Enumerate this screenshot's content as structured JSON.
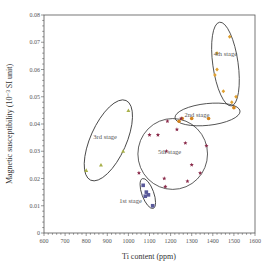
{
  "chart_data": {
    "type": "scatter",
    "title": "",
    "xlabel": "Ti content (ppm)",
    "ylabel": "Magnetic susceptibility (10⁻³ SI unit)",
    "xlim": [
      600,
      1600
    ],
    "ylim": [
      0,
      0.08
    ],
    "x_ticks": [
      "600",
      "700",
      "800",
      "900",
      "1000",
      "1100",
      "1200",
      "1300",
      "1400",
      "1500",
      "1600"
    ],
    "y_ticks": [
      "0",
      "0.01",
      "0.02",
      "0.03",
      "0.04",
      "0.05",
      "0.06",
      "0.07",
      "0.08"
    ],
    "grid": false,
    "legend": "none (stages labeled inside ellipses)",
    "series": [
      {
        "name": "1st stage",
        "marker": "square",
        "color": "#5a5a9a",
        "points": [
          [
            1070,
            0.0175
          ],
          [
            1085,
            0.015
          ],
          [
            1080,
            0.0135
          ],
          [
            1095,
            0.014
          ],
          [
            1115,
            0.01
          ]
        ]
      },
      {
        "name": "2nd stage",
        "marker": "circle",
        "color": "#d4841c",
        "points": [
          [
            1240,
            0.041
          ],
          [
            1255,
            0.042
          ],
          [
            1300,
            0.042
          ],
          [
            1380,
            0.042
          ],
          [
            1500,
            0.046
          ]
        ]
      },
      {
        "name": "3rd stage",
        "marker": "triangle",
        "color": "#a8b04a",
        "points": [
          [
            800,
            0.023
          ],
          [
            870,
            0.025
          ],
          [
            975,
            0.03
          ],
          [
            1000,
            0.045
          ]
        ]
      },
      {
        "name": "4th stage",
        "marker": "diamond",
        "color": "#e0a030",
        "points": [
          [
            1410,
            0.058
          ],
          [
            1420,
            0.066
          ],
          [
            1420,
            0.06
          ],
          [
            1450,
            0.052
          ],
          [
            1480,
            0.072
          ],
          [
            1490,
            0.048
          ],
          [
            1510,
            0.05
          ]
        ]
      },
      {
        "name": "5th stage",
        "marker": "star",
        "color": "#8a2a4a",
        "points": [
          [
            1050,
            0.022
          ],
          [
            1100,
            0.036
          ],
          [
            1140,
            0.036
          ],
          [
            1180,
            0.03
          ],
          [
            1170,
            0.02
          ],
          [
            1175,
            0.017
          ],
          [
            1230,
            0.038
          ],
          [
            1270,
            0.033
          ],
          [
            1280,
            0.019
          ],
          [
            1340,
            0.022
          ],
          [
            1370,
            0.032
          ],
          [
            1300,
            0.025
          ],
          [
            1185,
            0.041
          ],
          [
            1250,
            0.042
          ]
        ]
      }
    ],
    "ellipses": [
      {
        "label": "1st stage",
        "cx": 1092,
        "cy": 0.0145,
        "rx_ppm": 28,
        "ry": 0.0058,
        "angle": -20,
        "label_pos": [
          1010,
          0.011
        ]
      },
      {
        "label": "2nd stage",
        "cx": 1375,
        "cy": 0.0435,
        "rx_ppm": 155,
        "ry": 0.004,
        "angle": -6,
        "label_pos": [
          1325,
          0.0425
        ]
      },
      {
        "label": "3rd stage",
        "cx": 905,
        "cy": 0.034,
        "rx_ppm": 85,
        "ry": 0.016,
        "angle": 24,
        "label_pos": [
          890,
          0.0345
        ]
      },
      {
        "label": "4th stage",
        "cx": 1460,
        "cy": 0.062,
        "rx_ppm": 60,
        "ry": 0.0155,
        "angle": -8,
        "label_pos": [
          1460,
          0.065
        ]
      },
      {
        "label": "5th stage",
        "cx": 1210,
        "cy": 0.029,
        "rx_ppm": 165,
        "ry": 0.013,
        "angle": 0,
        "label_pos": [
          1195,
          0.029
        ]
      }
    ]
  },
  "labels": {
    "xlabel": "Ti content (ppm)",
    "ylabel": "Magnetic susceptibility (10⁻³ SI unit)",
    "stage1": "1st stage",
    "stage2": "2nd stage",
    "stage3": "3rd stage",
    "stage4": "4th stage",
    "stage5": "5th stage"
  }
}
